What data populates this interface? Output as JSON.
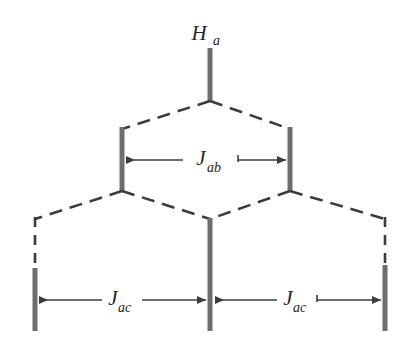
{
  "figure": {
    "type": "nmr-splitting-tree-diagram",
    "title": "",
    "background_color": "#ffffff",
    "line_color": "#3c3c3c",
    "bar_color": "#6e6e6e",
    "text_color": "#262626",
    "labels": {
      "top_nucleus": {
        "symbol": "H",
        "subscript": "a"
      },
      "coupling_ab": {
        "symbol": "J",
        "subscript": "ab"
      },
      "coupling_ac_left": {
        "symbol": "J",
        "subscript": "ac"
      },
      "coupling_ac_right": {
        "symbol": "J",
        "subscript": "ac"
      }
    },
    "levels": [
      {
        "name": "parent",
        "peaks": 1,
        "x_positions": [
          210
        ]
      },
      {
        "name": "doublet-from-Jab",
        "peaks": 2,
        "x_positions": [
          122,
          290
        ]
      },
      {
        "name": "triplet-from-Jac",
        "peaks": 3,
        "x_positions": [
          35,
          210,
          385
        ]
      }
    ],
    "measurements": [
      {
        "name": "J_ab",
        "x_start": 122,
        "x_end": 290,
        "y": 160
      },
      {
        "name": "J_ac_left",
        "x_start": 35,
        "x_end": 210,
        "y": 300
      },
      {
        "name": "J_ac_right",
        "x_start": 210,
        "x_end": 385,
        "y": 300
      }
    ]
  }
}
